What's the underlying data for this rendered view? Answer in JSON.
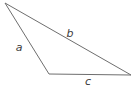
{
  "figure": {
    "type": "triangle-diagram",
    "width": 134,
    "height": 88,
    "background_color": "#ffffff",
    "stroke_color": "#6e6e6e",
    "stroke_width": 1,
    "label_color": "#3c3c3c",
    "vertices": [
      {
        "name": "top-left-apex",
        "x": 5,
        "y": 3
      },
      {
        "name": "bottom-left",
        "x": 49,
        "y": 74
      },
      {
        "name": "bottom-right",
        "x": 131,
        "y": 75
      }
    ],
    "sides": [
      {
        "label": "a",
        "from": "top-left-apex",
        "to": "bottom-left",
        "label_x": 19,
        "label_y": 47
      },
      {
        "label": "b",
        "from": "top-left-apex",
        "to": "bottom-right",
        "label_x": 70,
        "label_y": 33
      },
      {
        "label": "c",
        "from": "bottom-left",
        "to": "bottom-right",
        "label_x": 88,
        "label_y": 81
      }
    ],
    "polygon_points": "5,3 49,74 131,75"
  }
}
